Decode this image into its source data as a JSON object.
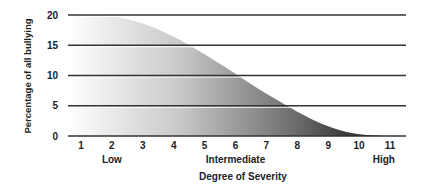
{
  "chart_data": {
    "type": "area",
    "title": "",
    "xlabel": "Degree of Severity",
    "ylabel": "Percentage of all bullying",
    "xlim": [
      0.6,
      11.5
    ],
    "ylim": [
      0,
      20
    ],
    "grid": "horizontal",
    "x_ticks": [
      "1",
      "2",
      "3",
      "4",
      "5",
      "6",
      "7",
      "8",
      "9",
      "10",
      "11"
    ],
    "y_ticks": [
      "0",
      "5",
      "10",
      "15",
      "20"
    ],
    "category_labels": [
      {
        "x": 2,
        "label": "Low"
      },
      {
        "x": 6,
        "label": "Intermediate"
      },
      {
        "x": 10.8,
        "label": "High"
      }
    ],
    "series": [
      {
        "name": "Bullying distribution",
        "x": [
          0.6,
          1,
          1.5,
          2,
          2.5,
          3,
          3.5,
          4,
          4.5,
          5,
          5.5,
          6,
          6.5,
          7,
          7.5,
          8,
          8.5,
          9,
          9.5,
          10,
          10.5,
          11
        ],
        "values": [
          20,
          20,
          20,
          19.8,
          19.3,
          18.6,
          17.6,
          16.4,
          15,
          13.5,
          11.9,
          10.3,
          8.6,
          7,
          5.5,
          4,
          2.7,
          1.6,
          0.8,
          0.3,
          0.1,
          0
        ]
      }
    ]
  }
}
